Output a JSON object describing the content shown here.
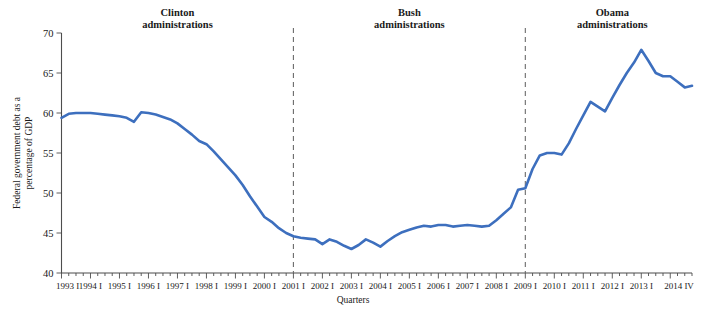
{
  "chart_data": {
    "type": "line",
    "title": "",
    "xlabel": "Quarters",
    "ylabel": "Federal government debt as a percentage of GDP",
    "ylim": [
      40,
      70
    ],
    "yticks": [
      40,
      45,
      50,
      55,
      60,
      65,
      70
    ],
    "ytick_labels": [
      "40",
      "45",
      "50",
      "55",
      "60",
      "65",
      "70"
    ],
    "grid": false,
    "legend_position": "none",
    "line_color": "#3d6fbe",
    "xtick_labels": [
      "1993 I",
      "1994 I",
      "1995 I",
      "1996 I",
      "1997 I",
      "1998 I",
      "1999 I",
      "2000 I",
      "2001 I",
      "2002 I",
      "2003 I",
      "2004 I",
      "2005 I",
      "2006 I",
      "2007 I",
      "2008 I",
      "2009 I",
      "2010 I",
      "2011 I",
      "2012 I",
      "2013 I",
      "2014 IV"
    ],
    "annotations": [
      {
        "name": "clinton",
        "label_line1": "Clinton",
        "label_line2": "administrations",
        "at_x": "1997 I"
      },
      {
        "name": "bush",
        "label_line1": "Bush",
        "label_line2": "administrations",
        "at_x": "2005 I"
      },
      {
        "name": "obama",
        "label_line1": "Obama",
        "label_line2": "administrations",
        "at_x": "2012 I"
      }
    ],
    "dividers": [
      {
        "name": "clinton-bush-divider",
        "at_x": "2001 I"
      },
      {
        "name": "bush-obama-divider",
        "at_x": "2009 I"
      }
    ],
    "x": [
      "1993 I",
      "1993 II",
      "1993 III",
      "1993 IV",
      "1994 I",
      "1994 II",
      "1994 III",
      "1994 IV",
      "1995 I",
      "1995 II",
      "1995 III",
      "1995 IV",
      "1996 I",
      "1996 II",
      "1996 III",
      "1996 IV",
      "1997 I",
      "1997 II",
      "1997 III",
      "1997 IV",
      "1998 I",
      "1998 II",
      "1998 III",
      "1998 IV",
      "1999 I",
      "1999 II",
      "1999 III",
      "1999 IV",
      "2000 I",
      "2000 II",
      "2000 III",
      "2000 IV",
      "2001 I",
      "2001 II",
      "2001 III",
      "2001 IV",
      "2002 I",
      "2002 II",
      "2002 III",
      "2002 IV",
      "2003 I",
      "2003 II",
      "2003 III",
      "2003 IV",
      "2004 I",
      "2004 II",
      "2004 III",
      "2004 IV",
      "2005 I",
      "2005 II",
      "2005 III",
      "2005 IV",
      "2006 I",
      "2006 II",
      "2006 III",
      "2006 IV",
      "2007 I",
      "2007 II",
      "2007 III",
      "2007 IV",
      "2008 I",
      "2008 II",
      "2008 III",
      "2008 IV",
      "2009 I",
      "2009 II",
      "2009 III",
      "2009 IV",
      "2010 I",
      "2010 II",
      "2010 III",
      "2010 IV",
      "2011 I",
      "2011 II",
      "2011 III",
      "2011 IV",
      "2012 I",
      "2012 II",
      "2012 III",
      "2012 IV",
      "2013 I",
      "2013 II",
      "2013 III",
      "2013 IV",
      "2014 I",
      "2014 II",
      "2014 III",
      "2014 IV"
    ],
    "values": [
      59.4,
      59.9,
      60.0,
      60.0,
      60.0,
      59.9,
      59.8,
      59.7,
      59.6,
      59.4,
      58.9,
      60.1,
      60.0,
      59.8,
      59.5,
      59.2,
      58.7,
      58.0,
      57.3,
      56.5,
      56.1,
      55.2,
      54.2,
      53.2,
      52.2,
      51.0,
      49.6,
      48.3,
      47.0,
      46.4,
      45.6,
      45.0,
      44.6,
      44.4,
      44.3,
      44.2,
      43.6,
      44.2,
      43.9,
      43.4,
      43.0,
      43.5,
      44.2,
      43.8,
      43.3,
      44.0,
      44.6,
      45.1,
      45.4,
      45.7,
      45.9,
      45.8,
      46.0,
      46.0,
      45.8,
      45.9,
      46.0,
      45.9,
      45.8,
      45.9,
      46.6,
      47.4,
      48.2,
      50.4,
      50.6,
      53.0,
      54.7,
      55.0,
      55.0,
      54.8,
      56.2,
      58.0,
      59.7,
      61.4,
      60.8,
      60.2,
      61.9,
      63.5,
      65.0,
      66.3,
      67.9,
      66.5,
      65.0,
      64.6,
      64.6,
      63.9,
      63.2,
      63.4
    ]
  }
}
